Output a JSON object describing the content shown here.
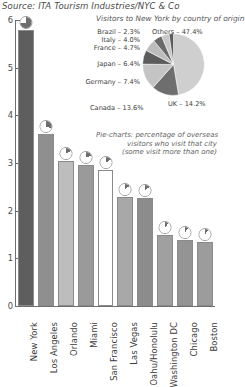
{
  "source_note": "Source: ITA Tourism Industries/NYC & Co",
  "chart_data": {
    "type": "bar",
    "title": "",
    "xlabel": "",
    "ylabel": "",
    "ylim": [
      0,
      6
    ],
    "yticks": [
      "0",
      "1",
      "2",
      "3",
      "4",
      "5",
      "6"
    ],
    "grid": false,
    "categories": [
      "New York",
      "Los Angeles",
      "Orlando",
      "Miami",
      "San Francisco",
      "Las Vegas",
      "Oahu/Honolulu",
      "Washington DC",
      "Chicago",
      "Boston"
    ],
    "values": [
      5.8,
      3.6,
      3.05,
      2.95,
      2.85,
      2.28,
      2.27,
      1.5,
      1.38,
      1.35
    ],
    "bar_colors": [
      "#5e5e5e",
      "#8f8f8f",
      "#bdbdbd",
      "#9a9a9a",
      "#ffffff",
      "#a8a8a8",
      "#8c8c8c",
      "#a0a0a0",
      "#949494",
      "#9c9c9c"
    ],
    "bar_pie_fractions": [
      0.74,
      0.3,
      0.18,
      0.2,
      0.16,
      0.14,
      0.14,
      0.11,
      0.1,
      0.1
    ],
    "annotations": [
      "Pie-charts: percentage of overseas",
      "visitors who visit that city",
      "(some visit more than one)"
    ]
  },
  "pie_inset": {
    "title": "Visitors to New York by country of origin",
    "caption_lines": [
      "Pie-charts: percentage of overseas",
      "visitors who visit that city",
      "(some visit more than one)"
    ],
    "type": "pie",
    "slices": [
      {
        "label": "Others",
        "value": 47.4,
        "text": "Others – 47.4%",
        "color": "#cfcfcf"
      },
      {
        "label": "UK",
        "value": 14.2,
        "text": "UK – 14.2%",
        "color": "#6e6e6e"
      },
      {
        "label": "Canada",
        "value": 13.6,
        "text": "Canada – 13.6%",
        "color": "#c4c4c4"
      },
      {
        "label": "Germany",
        "value": 7.4,
        "text": "Germany – 7.4%",
        "color": "#5c5c5c"
      },
      {
        "label": "Japan",
        "value": 6.4,
        "text": "Japan – 6.4%",
        "color": "#bdbdbd"
      },
      {
        "label": "France",
        "value": 4.7,
        "text": "France – 4.7%",
        "color": "#6a6a6a"
      },
      {
        "label": "Italy",
        "value": 4.0,
        "text": "Italy – 4.0%",
        "color": "#c8c8c8"
      },
      {
        "label": "Brazil",
        "value": 2.3,
        "text": "Brazil – 2.3%",
        "color": "#5a5a5a"
      }
    ]
  },
  "colors": {
    "axis": "#6f6f6f",
    "text": "#3a3a3a",
    "accent_dark": "#5e5e5e",
    "background": "#ffffff"
  }
}
